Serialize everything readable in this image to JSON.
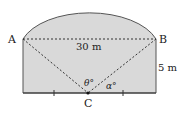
{
  "diagram": {
    "type": "geometry",
    "points": {
      "A": {
        "label": "A"
      },
      "B": {
        "label": "B"
      },
      "C": {
        "label": "C"
      }
    },
    "dimensions": {
      "ab_length": "30 m",
      "height": "5 m"
    },
    "angles": {
      "theta": "θ°",
      "alpha": "α°"
    },
    "colors": {
      "fill": "#d9d9d9",
      "stroke": "#444444",
      "dash": "#333333"
    }
  }
}
